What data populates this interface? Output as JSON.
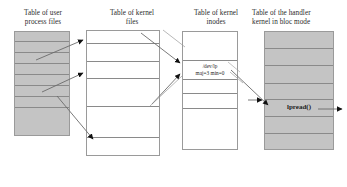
{
  "diagram": {
    "columns": [
      {
        "id": "user-process-files",
        "title": "Table of user\nprocess files",
        "title_line1": "Table of user",
        "title_line2": "process files",
        "fill": "#c4c4c4",
        "rows": 8
      },
      {
        "id": "kernel-files",
        "title_line1": "Table of kernel",
        "title_line2": "files",
        "fill": "#ffffff",
        "rows": 6
      },
      {
        "id": "kernel-inodes",
        "title_line1": "Table of kernel",
        "title_line2": "inodes",
        "fill": "#ffffff",
        "rows": 6,
        "cell_labels": [
          {
            "line1": "/dev/lp",
            "line2": "maj=3 min=0"
          }
        ]
      },
      {
        "id": "handler-kernel-bloc-mode",
        "title_line1": "Table of the handler",
        "title_line2": "kernel in bloc mode",
        "fill": "#c4c4c4",
        "rows": 6,
        "cell_labels": [
          {
            "line1": "lpread()"
          }
        ]
      }
    ],
    "labels": {
      "device_path": "/dev/lp",
      "device_numbers": "maj=3 min=0",
      "handler_function": "lpread()"
    },
    "colors": {
      "gray_fill": "#c4c4c4",
      "border": "#8d8d8d",
      "line": "#6b6b6b",
      "arrow": "#111111",
      "text": "#2b2b2b"
    },
    "connectors": [
      {
        "id": "user-to-kernelfiles-1",
        "from": "user-process-files",
        "to": "kernel-files"
      },
      {
        "id": "user-to-kernelfiles-2",
        "from": "user-process-files",
        "to": "kernel-files"
      },
      {
        "id": "user-to-kernelfiles-3",
        "from": "user-process-files",
        "to": "kernel-files"
      },
      {
        "id": "kernelfiles-to-inodes-1",
        "from": "kernel-files",
        "to": "kernel-inodes"
      },
      {
        "id": "kernelfiles-to-inodes-2",
        "from": "kernel-files",
        "to": "kernel-inodes"
      },
      {
        "id": "inode-to-handler",
        "from": "kernel-inodes",
        "to": "handler-kernel-bloc-mode"
      },
      {
        "id": "handler-out",
        "from": "handler-kernel-bloc-mode",
        "to": "device"
      }
    ]
  }
}
